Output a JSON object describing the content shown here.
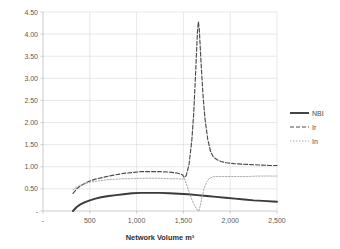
{
  "chart_data": {
    "type": "line",
    "title": "",
    "xlabel": "Network Volume m³",
    "ylabel": "",
    "xlim": [
      0,
      2500
    ],
    "ylim": [
      0,
      4.5
    ],
    "grid": true,
    "legend_position": "right",
    "x_tick_labels": [
      "-",
      "500",
      "1,000",
      "1,500",
      "2,000",
      "2,500"
    ],
    "x_tick_values": [
      0,
      500,
      1000,
      1500,
      2000,
      2500
    ],
    "y_tick_labels": [
      "-",
      "0.50",
      "1.00",
      "1.50",
      "2.00",
      "2.50",
      "3.00",
      "3.50",
      "4.00",
      "4.50"
    ],
    "y_tick_values": [
      0,
      0.5,
      1.0,
      1.5,
      2.0,
      2.5,
      3.0,
      3.5,
      4.0,
      4.5
    ],
    "series": [
      {
        "name": "NBI",
        "style": "solid",
        "color": "#3a3a3a",
        "x": [
          320,
          360,
          400,
          450,
          500,
          560,
          620,
          700,
          780,
          860,
          950,
          1050,
          1150,
          1250,
          1350,
          1450,
          1550,
          1650,
          1750,
          1850,
          1950,
          2050,
          2150,
          2250,
          2350,
          2500
        ],
        "values": [
          0.0,
          0.09,
          0.15,
          0.2,
          0.24,
          0.28,
          0.31,
          0.34,
          0.36,
          0.38,
          0.4,
          0.41,
          0.41,
          0.41,
          0.4,
          0.39,
          0.38,
          0.36,
          0.34,
          0.32,
          0.3,
          0.28,
          0.26,
          0.24,
          0.23,
          0.21
        ]
      },
      {
        "name": "Ir",
        "style": "dashed",
        "color": "#4a4a4a",
        "x": [
          320,
          360,
          400,
          450,
          500,
          560,
          620,
          700,
          780,
          860,
          950,
          1050,
          1150,
          1250,
          1350,
          1430,
          1490,
          1510,
          1530,
          1560,
          1590,
          1610,
          1630,
          1650,
          1660,
          1670,
          1690,
          1710,
          1730,
          1760,
          1790,
          1820,
          1860,
          1900,
          1960,
          2040,
          2120,
          2220,
          2320,
          2420,
          2500
        ],
        "values": [
          0.4,
          0.5,
          0.57,
          0.63,
          0.68,
          0.72,
          0.75,
          0.79,
          0.82,
          0.85,
          0.87,
          0.89,
          0.89,
          0.89,
          0.88,
          0.86,
          0.82,
          0.76,
          0.8,
          1.05,
          1.6,
          2.2,
          3.1,
          4.05,
          4.28,
          4.1,
          3.3,
          2.6,
          2.1,
          1.62,
          1.35,
          1.22,
          1.16,
          1.12,
          1.09,
          1.07,
          1.06,
          1.05,
          1.04,
          1.03,
          1.03
        ]
      },
      {
        "name": "In",
        "style": "dotted",
        "color": "#9a9a9a",
        "x": [
          320,
          360,
          400,
          450,
          500,
          560,
          620,
          700,
          780,
          860,
          950,
          1050,
          1150,
          1250,
          1350,
          1430,
          1490,
          1510,
          1530,
          1560,
          1590,
          1620,
          1650,
          1665,
          1680,
          1700,
          1720,
          1750,
          1780,
          1810,
          1850,
          1900,
          1980,
          2080,
          2180,
          2300,
          2420,
          2500
        ],
        "values": [
          0.48,
          0.54,
          0.58,
          0.62,
          0.65,
          0.67,
          0.69,
          0.71,
          0.72,
          0.73,
          0.73,
          0.74,
          0.74,
          0.74,
          0.73,
          0.73,
          0.72,
          0.74,
          0.62,
          0.44,
          0.26,
          0.12,
          0.02,
          0.0,
          0.12,
          0.32,
          0.5,
          0.66,
          0.74,
          0.77,
          0.78,
          0.78,
          0.78,
          0.78,
          0.78,
          0.79,
          0.79,
          0.79
        ]
      }
    ],
    "legend_entries": [
      {
        "label": "NBI",
        "style": "solid"
      },
      {
        "label": "Ir",
        "style": "dashed"
      },
      {
        "label": "In",
        "style": "dotted"
      }
    ]
  }
}
